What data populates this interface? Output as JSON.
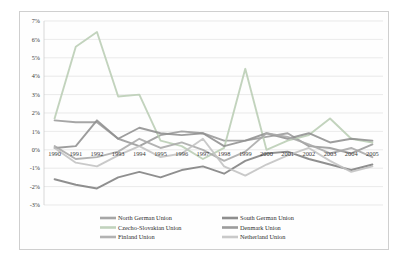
{
  "chart_data": {
    "type": "line",
    "title": "",
    "xlabel": "",
    "ylabel": "",
    "ylim": [
      -3,
      7
    ],
    "ytick_format": "percent",
    "yticks": [
      7,
      6,
      5,
      4,
      3,
      2,
      1,
      0,
      -1,
      -2,
      -3
    ],
    "ytick_labels": [
      "7%",
      "6%",
      "5%",
      "4%",
      "3%",
      "2%",
      "1%",
      "0%",
      "-1%",
      "-2%",
      "-3%"
    ],
    "grid": true,
    "legend_position": "bottom",
    "categories": [
      1990,
      1991,
      1992,
      1993,
      1994,
      1995,
      1996,
      1997,
      1998,
      1999,
      2000,
      2001,
      2002,
      2003,
      2004,
      2005
    ],
    "xtick_labels": [
      "1990",
      "1991",
      "1992",
      "1993",
      "1994",
      "1995",
      "1996",
      "1997",
      "1998",
      "1999",
      "2000",
      "2001",
      "2002",
      "2003",
      "2004",
      "2005"
    ],
    "series": [
      {
        "name": "North German Union",
        "color": "#9a9a9a",
        "values": [
          1.6,
          1.5,
          1.5,
          0.6,
          0.2,
          0.8,
          1.0,
          0.9,
          0.5,
          0.5,
          0.7,
          0.9,
          0.2,
          0.1,
          -0.2,
          0.3
        ]
      },
      {
        "name": "South German Union",
        "color": "#7f7f7f",
        "values": [
          -1.6,
          -1.9,
          -2.1,
          -1.5,
          -1.2,
          -1.5,
          -1.1,
          -0.9,
          -1.3,
          -0.6,
          -0.2,
          -0.1,
          -0.5,
          -0.8,
          -1.1,
          -0.8
        ]
      },
      {
        "name": "Czecho-Slovakian Union",
        "color": "#b9cdb4",
        "values": [
          1.7,
          5.6,
          6.4,
          2.9,
          3.0,
          0.5,
          0.2,
          -0.5,
          0.1,
          4.4,
          0.0,
          0.5,
          0.8,
          1.7,
          0.6,
          0.4
        ]
      },
      {
        "name": "Denmark Union",
        "color": "#8f8f8f",
        "values": [
          0.1,
          0.2,
          1.6,
          0.6,
          1.2,
          0.9,
          0.8,
          0.9,
          0.2,
          0.5,
          0.9,
          0.6,
          0.9,
          0.4,
          0.6,
          0.5
        ]
      },
      {
        "name": "Finland Union",
        "color": "#a8a8a8",
        "values": [
          0.2,
          -0.5,
          -0.4,
          -0.1,
          0.6,
          0.1,
          0.4,
          0.0,
          -0.6,
          -0.1,
          0.9,
          0.7,
          0.3,
          -0.2,
          0.1,
          -0.4
        ]
      },
      {
        "name": "Netherland Union",
        "color": "#c2c2c2",
        "values": [
          0.1,
          -0.7,
          -0.9,
          -0.3,
          0.2,
          -0.4,
          -0.2,
          0.6,
          -0.9,
          -1.4,
          -0.8,
          -0.3,
          0.1,
          -0.6,
          -1.2,
          -0.9
        ]
      }
    ]
  },
  "legend": {
    "entries": [
      "North German Union",
      "South German Union",
      "Czecho-Slovakian Union",
      "Denmark Union",
      "Finland Union",
      "Netherland Union"
    ]
  }
}
